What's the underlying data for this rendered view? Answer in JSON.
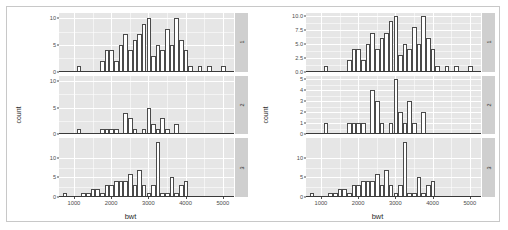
{
  "figure": {
    "type": "faceted-histogram-pair",
    "background": "#ffffff",
    "panel_fill": "#e6e6e6",
    "grid_color": "#ffffff",
    "strip_fill": "#cfcfcf",
    "bar_fill": "#ffffff",
    "bar_outline": "#4a4a4a"
  },
  "plots": [
    {
      "id": "left-plot",
      "scales": "fixed",
      "ylabel": "count",
      "xlabel": "bwt",
      "xticks": [
        "1000",
        "2000",
        "3000",
        "4000",
        "5000"
      ]
    },
    {
      "id": "right-plot",
      "scales": "free_y",
      "ylabel": "count",
      "xlabel": "bwt",
      "xticks": [
        "1000",
        "2000",
        "3000",
        "4000",
        "5000"
      ]
    }
  ],
  "strips": [
    "1",
    "2",
    "3"
  ],
  "chart_data": [
    {
      "type": "bar",
      "id": "left-facet-1",
      "title": "",
      "xlabel": "bwt",
      "ylabel": "count",
      "xlim": [
        600,
        5300
      ],
      "ylim": [
        0,
        11
      ],
      "yticks": [
        0,
        5,
        10
      ],
      "ytick_labels": [
        "0",
        "5",
        "10"
      ],
      "grid": true,
      "binwidth": 125,
      "bin_starts": [
        700,
        1075,
        1700,
        1825,
        1950,
        2075,
        2200,
        2325,
        2450,
        2575,
        2700,
        2825,
        2950,
        3075,
        3200,
        3325,
        3450,
        3575,
        3700,
        3825,
        3950,
        4075,
        4325,
        4575,
        4950
      ],
      "values": [
        0,
        1,
        2,
        4,
        4,
        2,
        5,
        7,
        4,
        6,
        7,
        9,
        10,
        3,
        5,
        4,
        8,
        5,
        10,
        6,
        4,
        1,
        1,
        1,
        1
      ]
    },
    {
      "type": "bar",
      "id": "left-facet-2",
      "title": "",
      "xlabel": "bwt",
      "ylabel": "count",
      "xlim": [
        600,
        5300
      ],
      "ylim": [
        0,
        11
      ],
      "yticks": [
        0,
        5,
        10
      ],
      "ytick_labels": [
        "0",
        "5",
        "10"
      ],
      "grid": true,
      "binwidth": 125,
      "bin_starts": [
        1075,
        1700,
        1825,
        1950,
        2075,
        2325,
        2450,
        2575,
        2825,
        2950,
        3075,
        3200,
        3325,
        3450,
        3700
      ],
      "values": [
        1,
        1,
        1,
        1,
        1,
        4,
        3,
        1,
        1,
        5,
        2,
        1,
        3,
        1,
        2
      ]
    },
    {
      "type": "bar",
      "id": "left-facet-3",
      "title": "",
      "xlabel": "bwt",
      "ylabel": "count",
      "xlim": [
        600,
        5300
      ],
      "ylim": [
        0,
        15
      ],
      "yticks": [
        0,
        5,
        10
      ],
      "ytick_labels": [
        "0",
        "5",
        "10"
      ],
      "grid": true,
      "binwidth": 125,
      "bin_starts": [
        700,
        825,
        1200,
        1325,
        1450,
        1575,
        1700,
        1825,
        1950,
        2075,
        2200,
        2325,
        2450,
        2575,
        2700,
        2825,
        2950,
        3075,
        3200,
        3325,
        3450,
        3575,
        3700,
        3825,
        3950,
        4075
      ],
      "values": [
        1,
        0,
        1,
        1,
        2,
        2,
        1,
        3,
        3,
        4,
        4,
        4,
        6,
        3,
        7,
        3,
        1,
        3,
        14,
        1,
        1,
        5,
        1,
        3,
        4,
        0
      ]
    },
    {
      "type": "bar",
      "id": "right-facet-1",
      "title": "",
      "xlabel": "bwt",
      "ylabel": "count",
      "xlim": [
        600,
        5300
      ],
      "ylim": [
        0,
        10.5
      ],
      "yticks": [
        0.0,
        2.5,
        5.0,
        7.5,
        10.0
      ],
      "ytick_labels": [
        "0.0",
        "2.5",
        "5.0",
        "7.5",
        "10.0"
      ],
      "grid": true,
      "binwidth": 125,
      "bin_starts": [
        700,
        1075,
        1700,
        1825,
        1950,
        2075,
        2200,
        2325,
        2450,
        2575,
        2700,
        2825,
        2950,
        3075,
        3200,
        3325,
        3450,
        3575,
        3700,
        3825,
        3950,
        4075,
        4325,
        4575,
        4950
      ],
      "values": [
        0,
        1,
        2,
        4,
        4,
        2,
        5,
        7,
        4,
        6,
        7,
        9,
        10,
        3,
        5,
        4,
        8,
        5,
        10,
        6,
        4,
        1,
        1,
        1,
        1
      ]
    },
    {
      "type": "bar",
      "id": "right-facet-2",
      "title": "",
      "xlabel": "bwt",
      "ylabel": "count",
      "xlim": [
        600,
        5300
      ],
      "ylim": [
        0,
        5.3
      ],
      "yticks": [
        0,
        1,
        2,
        3,
        4,
        5
      ],
      "ytick_labels": [
        "0",
        "1",
        "2",
        "3",
        "4",
        "5"
      ],
      "grid": true,
      "binwidth": 125,
      "bin_starts": [
        1075,
        1700,
        1825,
        1950,
        2075,
        2325,
        2450,
        2575,
        2825,
        2950,
        3075,
        3200,
        3325,
        3450,
        3700
      ],
      "values": [
        1,
        1,
        1,
        1,
        1,
        4,
        3,
        1,
        1,
        5,
        2,
        1,
        3,
        1,
        2
      ]
    },
    {
      "type": "bar",
      "id": "right-facet-3",
      "title": "",
      "xlabel": "bwt",
      "ylabel": "count",
      "xlim": [
        600,
        5300
      ],
      "ylim": [
        0,
        15
      ],
      "yticks": [
        0,
        5,
        10
      ],
      "ytick_labels": [
        "0",
        "5",
        "10"
      ],
      "grid": true,
      "binwidth": 125,
      "bin_starts": [
        700,
        825,
        1200,
        1325,
        1450,
        1575,
        1700,
        1825,
        1950,
        2075,
        2200,
        2325,
        2450,
        2575,
        2700,
        2825,
        2950,
        3075,
        3200,
        3325,
        3450,
        3575,
        3700,
        3825,
        3950,
        4075
      ],
      "values": [
        1,
        0,
        1,
        1,
        2,
        2,
        1,
        3,
        3,
        4,
        4,
        4,
        6,
        3,
        7,
        3,
        1,
        3,
        14,
        1,
        1,
        5,
        1,
        3,
        4,
        0
      ]
    }
  ]
}
